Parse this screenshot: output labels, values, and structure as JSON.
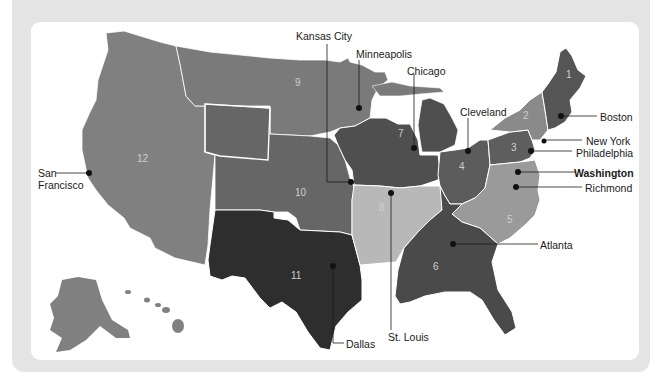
{
  "figure": {
    "background_color": "#e4e4e4",
    "card_color": "#ffffff"
  },
  "districts": [
    {
      "number": "1",
      "bank_city": "Boston",
      "shade": "#5a5a5a"
    },
    {
      "number": "2",
      "bank_city": "New York",
      "shade": "#8a8a8a"
    },
    {
      "number": "3",
      "bank_city": "Philadelphia",
      "shade": "#5e5e5e"
    },
    {
      "number": "4",
      "bank_city": "Cleveland",
      "shade": "#5c5c5c"
    },
    {
      "number": "5",
      "bank_city": "Richmond",
      "shade": "#9a9a9a"
    },
    {
      "number": "6",
      "bank_city": "Atlanta",
      "shade": "#4a4a4a"
    },
    {
      "number": "7",
      "bank_city": "Chicago",
      "shade": "#4e4e4e"
    },
    {
      "number": "8",
      "bank_city": "St. Louis",
      "shade": "#b8b8b8"
    },
    {
      "number": "9",
      "bank_city": "Minneapolis",
      "shade": "#7c7c7c"
    },
    {
      "number": "10",
      "bank_city": "Kansas City",
      "shade": "#666666"
    },
    {
      "number": "11",
      "bank_city": "Dallas",
      "shade": "#2e2e2e"
    },
    {
      "number": "12",
      "bank_city": "San Francisco",
      "shade": "#808080"
    }
  ],
  "city_labels": {
    "kansas_city": "Kansas City",
    "minneapolis": "Minneapolis",
    "chicago": "Chicago",
    "cleveland": "Cleveland",
    "boston": "Boston",
    "new_york": "New York",
    "philadelphia": "Philadelphia",
    "washington": "Washington",
    "richmond": "Richmond",
    "atlanta": "Atlanta",
    "san_francisco_line1": "San",
    "san_francisco_line2": "Francisco",
    "st_louis": "St. Louis",
    "dallas": "Dallas"
  },
  "district_numbers": {
    "d1": "1",
    "d2": "2",
    "d3": "3",
    "d4": "4",
    "d5": "5",
    "d6": "6",
    "d7": "7",
    "d8": "8",
    "d9": "9",
    "d10": "10",
    "d11": "11",
    "d12": "12"
  },
  "headquarters_note": "Washington (Board of Governors) shown in bold"
}
